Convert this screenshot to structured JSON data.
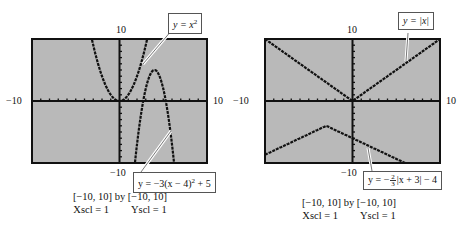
{
  "panels": [
    {
      "window": {
        "label": "[−10, 10] by [−10, 10]",
        "xscl": "Xscl = 1",
        "yscl": "Yscl = 1"
      },
      "axis_labels": {
        "ymax": "10",
        "ymin": "−10",
        "xmin": "−10",
        "xmax": "10"
      },
      "callouts": [
        {
          "id": "f1",
          "text_pre": "y = x",
          "sup": "2"
        },
        {
          "id": "f2",
          "text_pre": "y = −3(x − 4)",
          "sup": "2",
          "text_post": " + 5"
        }
      ]
    },
    {
      "window": {
        "label": "[−10, 10] by [−10, 10]",
        "xscl": "Xscl = 1",
        "yscl": "Yscl = 1"
      },
      "axis_labels": {
        "ymax": "10",
        "ymin": "−10",
        "xmin": "−10",
        "xmax": "10"
      },
      "callouts": [
        {
          "id": "g1",
          "text": "y = |x|"
        },
        {
          "id": "g2",
          "pre": "y = −",
          "num": "2",
          "den": "3",
          "post": "|x + 3| − 4"
        }
      ]
    }
  ],
  "chart_data": [
    {
      "type": "line",
      "title": "",
      "xlim": [
        -10,
        10
      ],
      "ylim": [
        -10,
        10
      ],
      "xscl": 1,
      "yscl": 1,
      "grid": false,
      "series": [
        {
          "name": "y = x^2",
          "equation": "x^2",
          "points": [
            [
              -3.2,
              10
            ],
            [
              -2,
              4
            ],
            [
              -1,
              1
            ],
            [
              0,
              0
            ],
            [
              1,
              1
            ],
            [
              2,
              4
            ],
            [
              3.2,
              10
            ]
          ]
        },
        {
          "name": "y = -3(x-4)^2 + 5",
          "equation": "-3*(x-4)^2+5",
          "points": [
            [
              1.4,
              -10
            ],
            [
              2,
              -7
            ],
            [
              3,
              2
            ],
            [
              4,
              5
            ],
            [
              5,
              2
            ],
            [
              6,
              -7
            ],
            [
              6.6,
              -10
            ]
          ]
        }
      ],
      "annotations": [
        "y = x^2",
        "y = -3(x - 4)^2 + 5"
      ]
    },
    {
      "type": "line",
      "title": "",
      "xlim": [
        -10,
        10
      ],
      "ylim": [
        -10,
        10
      ],
      "xscl": 1,
      "yscl": 1,
      "grid": false,
      "series": [
        {
          "name": "y = |x|",
          "equation": "abs(x)",
          "points": [
            [
              -10,
              10
            ],
            [
              0,
              0
            ],
            [
              10,
              10
            ]
          ]
        },
        {
          "name": "y = -(2/3)|x + 3| - 4",
          "equation": "-(2/3)*abs(x+3)-4",
          "points": [
            [
              -10,
              -8.67
            ],
            [
              -3,
              -4
            ],
            [
              0,
              -6
            ],
            [
              6,
              -10
            ]
          ]
        }
      ],
      "annotations": [
        "y = |x|",
        "y = -(2/3)|x + 3| - 4"
      ]
    }
  ]
}
